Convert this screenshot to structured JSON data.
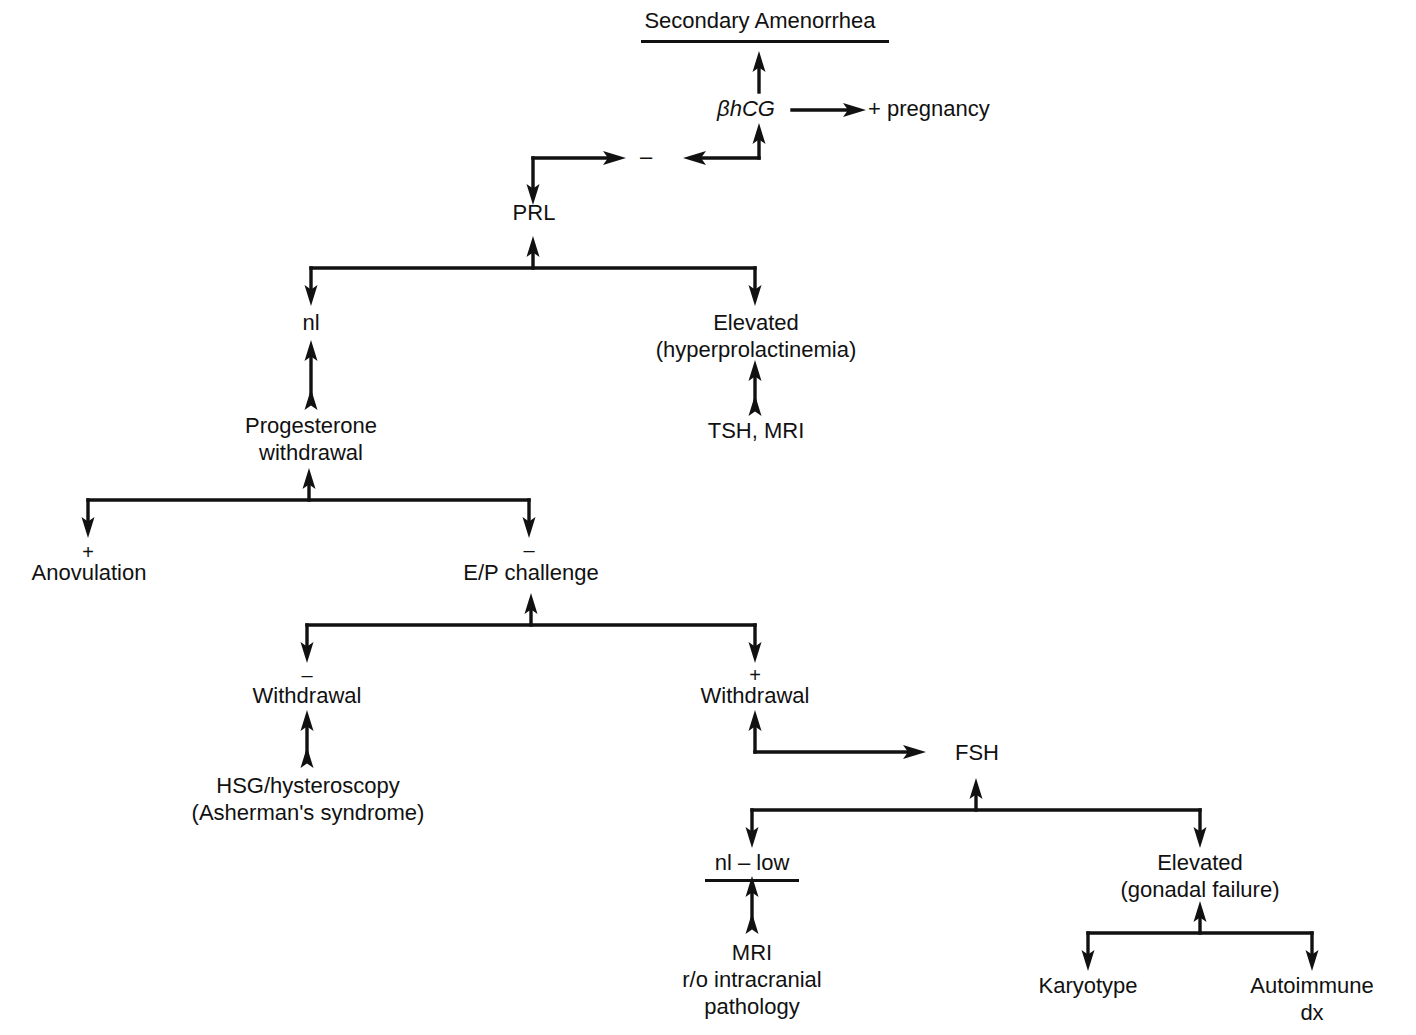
{
  "diagram": {
    "title": "Secondary Amenorrhea",
    "type": "clinical-algorithm-flowchart",
    "nodes": {
      "title": "Secondary Amenorrhea",
      "bhcg": "βhCG",
      "pregnancy": "+ pregnancy",
      "prl": "PRL",
      "prl_normal": "nl",
      "prl_elevated": "Elevated\n(hyperprolactinemia)",
      "tsh_mri": "TSH, MRI",
      "progesterone_withdrawal": "Progesterone\nwithdrawal",
      "anovulation": "Anovulation",
      "ep_challenge": "E/P challenge",
      "withdrawal_neg": "Withdrawal",
      "hsg": "HSG/hysteroscopy\n(Asherman's syndrome)",
      "withdrawal_pos": "Withdrawal",
      "fsh": "FSH",
      "fsh_nl_low": "nl – low",
      "mri_intracranial": "MRI\nr/o intracranial\npathology",
      "fsh_elevated": "Elevated\n(gonadal failure)",
      "karyotype": "Karyotype",
      "autoimmune": "Autoimmune\ndx"
    },
    "signs": {
      "negative_feedback": "–",
      "anovulation_plus": "+",
      "ep_challenge_minus": "–",
      "withdrawal_neg_minus": "–",
      "withdrawal_pos_plus": "+"
    },
    "colors": {
      "ink": "#111111",
      "background": "#ffffff"
    }
  }
}
